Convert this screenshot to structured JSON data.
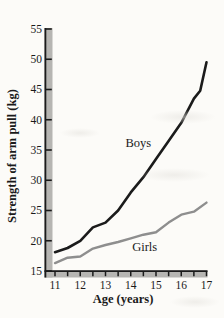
{
  "figure_title": "Strength of arm pull by age for boys and girls",
  "chart_data": {
    "type": "line",
    "title": "",
    "xlabel": "Age (years)",
    "ylabel": "Strength of arm pull (kg)",
    "xlim": [
      11,
      17
    ],
    "ylim": [
      15,
      55
    ],
    "xticks": [
      11,
      12,
      13,
      14,
      15,
      16,
      17
    ],
    "xtick_minor_step": 0.5,
    "yticks": [
      15,
      20,
      25,
      30,
      35,
      40,
      45,
      50,
      55
    ],
    "grid": false,
    "legend_position": "inline-labels",
    "series": [
      {
        "name": "Boys",
        "color": "#1b1b1b",
        "stroke_width": 2.6,
        "points": [
          [
            11,
            18.1
          ],
          [
            11.5,
            18.8
          ],
          [
            12,
            20.0
          ],
          [
            12.5,
            22.2
          ],
          [
            13,
            23.0
          ],
          [
            13.5,
            25.0
          ],
          [
            14,
            28.0
          ],
          [
            14.5,
            30.5
          ],
          [
            15,
            33.5
          ],
          [
            15.5,
            36.5
          ],
          [
            16,
            39.5
          ],
          [
            16.5,
            43.5
          ],
          [
            16.75,
            44.8
          ],
          [
            17,
            49.5
          ]
        ],
        "label": {
          "text": "Boys",
          "x": 14.3,
          "y": 36.2
        }
      },
      {
        "name": "Girls",
        "color": "#8e8e8e",
        "stroke_width": 2.4,
        "points": [
          [
            11,
            16.3
          ],
          [
            11.5,
            17.2
          ],
          [
            12,
            17.4
          ],
          [
            12.5,
            18.7
          ],
          [
            13,
            19.3
          ],
          [
            13.5,
            19.8
          ],
          [
            14,
            20.4
          ],
          [
            14.5,
            21.0
          ],
          [
            15,
            21.4
          ],
          [
            15.5,
            23.0
          ],
          [
            16,
            24.3
          ],
          [
            16.5,
            24.8
          ],
          [
            17,
            26.3
          ]
        ],
        "label": {
          "text": "Girls",
          "x": 14.55,
          "y": 18.9
        }
      }
    ],
    "axis_style": {
      "bar_color": "#b6b5b2",
      "edge_color": "#1a1a1a",
      "tick_color": "#1a1a1a",
      "label_color": "#1a1a1a",
      "background": "#fcfbf8"
    }
  }
}
